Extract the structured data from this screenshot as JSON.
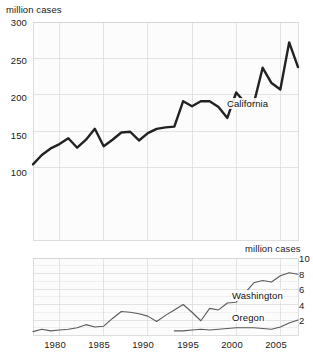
{
  "chart_data": [
    {
      "type": "line",
      "title": "",
      "ylabel": "million cases",
      "xlabel": "",
      "ylim": [
        0,
        300
      ],
      "xlim": [
        1977,
        2007
      ],
      "grid": true,
      "legend_position": "inline-annotation",
      "y_ticks": [
        "300",
        "250",
        "200",
        "150",
        "100"
      ],
      "y_tick_values": [
        300,
        250,
        200,
        150,
        100
      ],
      "x_ticks": [
        "1980",
        "1985",
        "1990",
        "1995",
        "2000",
        "2005"
      ],
      "x_tick_values": [
        1980,
        1985,
        1990,
        1995,
        2000,
        2005
      ],
      "series": [
        {
          "name": "California",
          "x": [
            1977,
            1978,
            1979,
            1980,
            1981,
            1982,
            1983,
            1984,
            1985,
            1986,
            1987,
            1988,
            1989,
            1990,
            1991,
            1992,
            1993,
            1994,
            1995,
            1996,
            1997,
            1998,
            1999,
            2000,
            2001,
            2002,
            2003,
            2004,
            2005,
            2006,
            2007
          ],
          "values": [
            104,
            117,
            126,
            132,
            140,
            127,
            138,
            153,
            129,
            138,
            148,
            149,
            137,
            147,
            153,
            155,
            156,
            191,
            184,
            191,
            191,
            183,
            168,
            203,
            189,
            188,
            237,
            216,
            207,
            272,
            238
          ]
        }
      ]
    },
    {
      "type": "line",
      "title": "",
      "ylabel": "million cases",
      "xlabel": "",
      "ylim": [
        0,
        10
      ],
      "xlim": [
        1977,
        2007
      ],
      "grid": true,
      "legend_position": "inline-annotation",
      "y_ticks": [
        "10",
        "8",
        "6",
        "4",
        "2"
      ],
      "y_tick_values": [
        10,
        8,
        6,
        4,
        2
      ],
      "x_ticks": [
        "1980",
        "1985",
        "1990",
        "1995",
        "2000",
        "2005"
      ],
      "x_tick_values": [
        1980,
        1985,
        1990,
        1995,
        2000,
        2005
      ],
      "series": [
        {
          "name": "Washington",
          "x": [
            1977,
            1978,
            1979,
            1980,
            1981,
            1982,
            1983,
            1984,
            1985,
            1986,
            1987,
            1988,
            1989,
            1990,
            1991,
            1992,
            1993,
            1994,
            1995,
            1996,
            1997,
            1998,
            1999,
            2000,
            2001,
            2002,
            2003,
            2004,
            2005,
            2006,
            2007
          ],
          "values": [
            0.5,
            0.8,
            0.6,
            0.7,
            0.8,
            1.0,
            1.4,
            1.1,
            1.2,
            2.2,
            3.1,
            3.0,
            2.8,
            2.5,
            1.8,
            2.6,
            3.3,
            4.0,
            3.0,
            1.9,
            3.5,
            3.3,
            4.2,
            4.3,
            5.5,
            6.8,
            7.1,
            6.9,
            7.7,
            8.1,
            7.9
          ]
        },
        {
          "name": "Oregon",
          "x": [
            1993,
            1994,
            1995,
            1996,
            1997,
            1998,
            1999,
            2000,
            2001,
            2002,
            2003,
            2004,
            2005,
            2006,
            2007
          ],
          "values": [
            0.6,
            0.6,
            0.7,
            0.8,
            0.7,
            0.8,
            0.9,
            1.0,
            1.0,
            1.0,
            0.9,
            0.8,
            1.1,
            1.6,
            2.0
          ]
        }
      ]
    }
  ],
  "top_chart": {
    "axis_title": "million cases",
    "y_ticks": [
      "300",
      "250",
      "200",
      "150",
      "100"
    ],
    "series_label": "California"
  },
  "bottom_chart": {
    "axis_title": "million cases",
    "y_ticks": [
      "10",
      "8",
      "6",
      "4",
      "2"
    ],
    "series_label_washington": "Washington",
    "series_label_oregon": "Oregon"
  },
  "x_axis": {
    "ticks": [
      "1980",
      "1985",
      "1990",
      "1995",
      "2000",
      "2005"
    ]
  },
  "colors": {
    "line_primary": "#222222",
    "line_secondary": "#5a5a5a",
    "grid": "#d9d9d9",
    "text": "#1a1a1a",
    "plot_background": "#fcfcfc"
  }
}
